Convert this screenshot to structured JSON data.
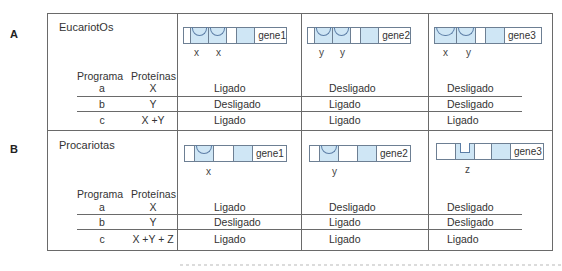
{
  "panels": [
    {
      "letter": "A",
      "title": "EucariotOs",
      "headers": {
        "program": "Programa",
        "proteins": "Proteínas"
      },
      "genes": [
        {
          "name": "gene1",
          "sites": [
            "x",
            "x"
          ]
        },
        {
          "name": "gene2",
          "sites": [
            "y",
            "y"
          ]
        },
        {
          "name": "gene3",
          "sites": [
            "x",
            "y"
          ]
        }
      ],
      "rows": [
        {
          "program": "a",
          "proteins": "X",
          "gene1": "Ligado",
          "gene2": "Desligado",
          "gene3": "Desligado"
        },
        {
          "program": "b",
          "proteins": "Y",
          "gene1": "Desligado",
          "gene2": "Ligado",
          "gene3": "Desligado"
        },
        {
          "program": "c",
          "proteins": "X +Y",
          "gene1": "Ligado",
          "gene2": "Ligado",
          "gene3": "Ligado"
        }
      ]
    },
    {
      "letter": "B",
      "title": "Procariotas",
      "headers": {
        "program": "Programa",
        "proteins": "Proteínas"
      },
      "genes": [
        {
          "name": "gene1",
          "sites": [
            "x"
          ]
        },
        {
          "name": "gene2",
          "sites": [
            "y"
          ]
        },
        {
          "name": "gene3",
          "sites": [
            "z"
          ]
        }
      ],
      "rows": [
        {
          "program": "a",
          "proteins": "X",
          "gene1": "Ligado",
          "gene2": "Desligado",
          "gene3": "Desligado"
        },
        {
          "program": "b",
          "proteins": "Y",
          "gene1": "Desligado",
          "gene2": "Ligado",
          "gene3": "Desligado"
        },
        {
          "program": "c",
          "proteins": "X +Y + Z",
          "gene1": "Ligado",
          "gene2": "Ligado",
          "gene3": "Ligado"
        }
      ]
    }
  ],
  "colors": {
    "regulatory_fill": "#cfe6f5",
    "frame": "#6a6a6a",
    "site_outline": "#5c7ea6"
  }
}
